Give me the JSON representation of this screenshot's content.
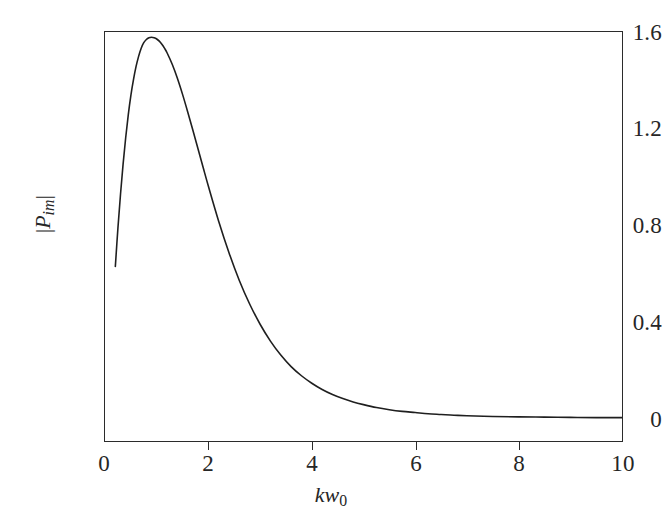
{
  "figure": {
    "background_color": "#ffffff",
    "line_color": "#1f1f1f",
    "axis_color": "#2b2b2b"
  },
  "axes": {
    "y_title_parts": {
      "left_bar": "|",
      "symbol": "P",
      "subscript": "im",
      "right_bar": "|"
    },
    "x_title_parts": {
      "symbol_k": "k",
      "symbol_w": "w",
      "subscript": "0"
    },
    "y_ticks": [
      "0",
      "0.4",
      "0.8",
      "1.2",
      "1.6"
    ],
    "x_ticks": [
      "0",
      "2",
      "4",
      "6",
      "8",
      "10"
    ]
  },
  "chart_data": {
    "type": "line",
    "title": "",
    "subtitle": "",
    "xlabel": "kw0",
    "ylabel": "|P_im|",
    "xlim": [
      0,
      10
    ],
    "ylim": [
      0,
      1.6
    ],
    "xticks": [
      0,
      2,
      4,
      6,
      8,
      10
    ],
    "yticks": [
      0,
      0.4,
      0.8,
      1.2,
      1.6
    ],
    "grid": false,
    "legend": null,
    "annotations": [],
    "series": [
      {
        "name": "|P_im|",
        "color": "#1f1f1f",
        "linewidth": 1.6,
        "x": [
          0.2,
          0.25,
          0.3,
          0.35,
          0.4,
          0.45,
          0.5,
          0.55,
          0.6,
          0.65,
          0.7,
          0.75,
          0.8,
          0.85,
          0.9,
          0.95,
          1.0,
          1.05,
          1.1,
          1.15,
          1.2,
          1.3,
          1.4,
          1.5,
          1.6,
          1.7,
          1.8,
          1.9,
          2.0,
          2.2,
          2.4,
          2.6,
          2.8,
          3.0,
          3.2,
          3.4,
          3.6,
          3.8,
          4.0,
          4.2,
          4.4,
          4.6,
          4.8,
          5.0,
          5.25,
          5.5,
          5.75,
          6.0,
          6.25,
          6.5,
          6.75,
          7.0,
          7.5,
          8.0,
          8.5,
          9.0,
          9.5,
          10.0
        ],
        "y": [
          0.63,
          0.79,
          0.93,
          1.055,
          1.165,
          1.26,
          1.34,
          1.405,
          1.46,
          1.503,
          1.537,
          1.56,
          1.573,
          1.58,
          1.582,
          1.58,
          1.575,
          1.566,
          1.553,
          1.537,
          1.518,
          1.47,
          1.412,
          1.345,
          1.272,
          1.196,
          1.118,
          1.04,
          0.963,
          0.817,
          0.686,
          0.571,
          0.473,
          0.39,
          0.32,
          0.262,
          0.214,
          0.176,
          0.145,
          0.119,
          0.098,
          0.081,
          0.067,
          0.056,
          0.044,
          0.035,
          0.028,
          0.023,
          0.018,
          0.015,
          0.012,
          0.01,
          0.007,
          0.005,
          0.004,
          0.003,
          0.002,
          0.002
        ]
      }
    ],
    "peak": {
      "x": 0.92,
      "y": 1.582
    },
    "start_point": {
      "x": 0.2,
      "y": 0.63
    },
    "end_point": {
      "x": 10.0,
      "y": 0.002
    }
  }
}
